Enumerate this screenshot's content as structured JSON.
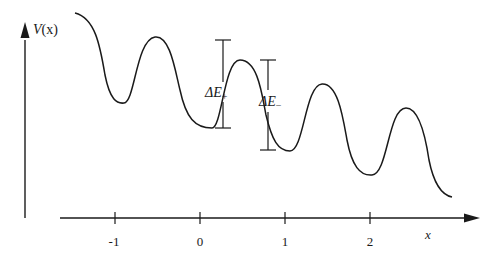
{
  "diagram": {
    "type": "potential-energy-curve",
    "y_axis": {
      "label_symbol": "V",
      "label_arg": "(x)"
    },
    "x_axis": {
      "label": "x",
      "ticks": [
        "-1",
        "0",
        "1",
        "2"
      ]
    },
    "annotations": {
      "delta_plus": {
        "symbol": "ΔE",
        "subscript": "+"
      },
      "delta_minus": {
        "symbol": "ΔE",
        "subscript": "−"
      }
    },
    "colors": {
      "line": "#1a1a1a",
      "background": "#ffffff"
    }
  }
}
